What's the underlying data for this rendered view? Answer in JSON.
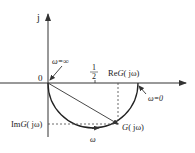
{
  "figure": {
    "type": "nyquist-plot",
    "labels": {
      "imag_axis": "j",
      "origin": "0",
      "omega_inf": "ω=∞",
      "half_num": "1",
      "half_den": "2",
      "real_axis_pre": "Re",
      "real_axis_G": "G",
      "real_axis_arg": "( jω)",
      "omega_zero": "ω=0",
      "imag_part_pre": "Im",
      "imag_part_G": "G",
      "imag_part_arg": "( jω)",
      "point_G": "G",
      "point_arg": "( jω)",
      "omega_dir": "ω"
    },
    "colors": {
      "line": "#333333",
      "background": "#ffffff"
    }
  }
}
